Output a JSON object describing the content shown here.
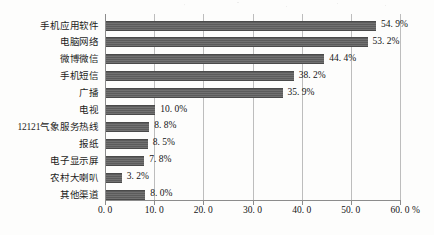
{
  "chart_data": {
    "type": "bar",
    "orientation": "horizontal",
    "title": "",
    "xlabel": "%",
    "ylabel": "",
    "xlim": [
      0.0,
      60.0
    ],
    "xticks": [
      "0.0",
      "10.0",
      "20.0",
      "30.0",
      "40.0",
      "50.0",
      "60.0"
    ],
    "grid": true,
    "legend": "none",
    "bar_color": "#5c5c5c",
    "categories": [
      "手机应用软件",
      "电脑网络",
      "微博微信",
      "手机短信",
      "广播",
      "电视",
      "12121气象服务热线",
      "报纸",
      "电子显示屏",
      "农村大喇叭",
      "其他渠道"
    ],
    "values": [
      54.9,
      53.2,
      44.4,
      38.2,
      35.9,
      10.0,
      8.8,
      8.5,
      7.8,
      3.2,
      8.0
    ],
    "data_labels": [
      "54.9%",
      "53.2%",
      "44.4%",
      "38.2%",
      "35.9%",
      "10.0%",
      "8.8%",
      "8.5%",
      "7.8%",
      "3.2%",
      "8.0%"
    ]
  }
}
